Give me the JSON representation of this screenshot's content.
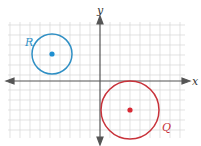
{
  "diagram": {
    "axes": {
      "x_label": "x",
      "y_label": "y"
    },
    "grid": {
      "spacing_px": 10,
      "color": "#cfcfcf"
    },
    "circles": [
      {
        "label": "R",
        "color": "#2f8fc4",
        "center": [
          -5,
          3
        ],
        "radius": 2
      },
      {
        "label": "Q",
        "color": "#c8323a",
        "center": [
          3,
          -3
        ],
        "radius": 3
      }
    ]
  }
}
